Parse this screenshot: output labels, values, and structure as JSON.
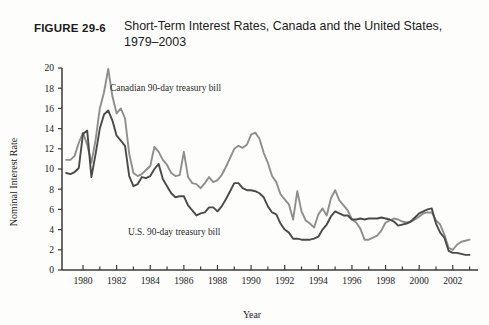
{
  "figure": {
    "number_label": "FIGURE 29-6",
    "caption": "Short-Term Interest Rates, Canada and the United States, 1979–2003"
  },
  "colors": {
    "canada_line": "#8e8e8e",
    "us_line": "#4a4a4a",
    "axis": "#3a3a3a",
    "text": "#1b1b1b",
    "background": "#fdfdfb"
  },
  "annotations": {
    "canada_series_label": "Canadian 90-day treasury bill",
    "us_series_label": "U.S. 90-day treasury bill"
  },
  "chart_data": {
    "type": "line",
    "title": "Short-Term Interest Rates, Canada and the United States, 1979–2003",
    "xlabel": "Year",
    "ylabel": "Nominal Interest Rate",
    "xlim": [
      1978.75,
      2003.5
    ],
    "ylim": [
      0,
      20
    ],
    "ytick_values": [
      0,
      2,
      4,
      6,
      8,
      10,
      12,
      14,
      16,
      18,
      20
    ],
    "ytick_labels": [
      "0",
      "2",
      "4",
      "6",
      "8",
      "10",
      "12",
      "14",
      "16",
      "18",
      "20"
    ],
    "xtick_values": [
      1980,
      1982,
      1984,
      1986,
      1988,
      1990,
      1992,
      1994,
      1996,
      1998,
      2000,
      2002
    ],
    "xtick_labels": [
      "1980",
      "1982",
      "1984",
      "1986",
      "1988",
      "1990",
      "1992",
      "1994",
      "1996",
      "1998",
      "2000",
      "2002"
    ],
    "xtick_minor_values": [
      1981,
      1983,
      1985,
      1987,
      1989,
      1991,
      1993,
      1995,
      1997,
      1999,
      2001,
      2003
    ],
    "grid": false,
    "legend_position": "inline-annotations",
    "series": [
      {
        "name": "Canadian 90-day treasury bill",
        "color": "#8e8e8e",
        "x": [
          1979.0,
          1979.25,
          1979.5,
          1979.75,
          1980.0,
          1980.25,
          1980.5,
          1980.75,
          1981.0,
          1981.25,
          1981.5,
          1981.75,
          1982.0,
          1982.25,
          1982.5,
          1982.75,
          1983.0,
          1983.25,
          1983.5,
          1983.75,
          1984.0,
          1984.25,
          1984.5,
          1984.75,
          1985.0,
          1985.25,
          1985.5,
          1985.75,
          1986.0,
          1986.25,
          1986.5,
          1986.75,
          1987.0,
          1987.25,
          1987.5,
          1987.75,
          1988.0,
          1988.25,
          1988.5,
          1988.75,
          1989.0,
          1989.25,
          1989.5,
          1989.75,
          1990.0,
          1990.25,
          1990.5,
          1990.75,
          1991.0,
          1991.25,
          1991.5,
          1991.75,
          1992.0,
          1992.25,
          1992.5,
          1992.75,
          1993.0,
          1993.25,
          1993.5,
          1993.75,
          1994.0,
          1994.25,
          1994.5,
          1994.75,
          1995.0,
          1995.25,
          1995.5,
          1995.75,
          1996.0,
          1996.25,
          1996.5,
          1996.75,
          1997.0,
          1997.25,
          1997.5,
          1997.75,
          1998.0,
          1998.25,
          1998.5,
          1998.75,
          1999.0,
          1999.25,
          1999.5,
          1999.75,
          2000.0,
          2000.25,
          2000.5,
          2000.75,
          2001.0,
          2001.25,
          2001.5,
          2001.75,
          2002.0,
          2002.25,
          2002.5,
          2002.75,
          2003.0
        ],
        "y": [
          10.9,
          10.9,
          11.3,
          12.6,
          13.6,
          12.4,
          10.6,
          12.9,
          16.0,
          17.6,
          19.9,
          17.2,
          15.5,
          16.0,
          15.0,
          11.5,
          9.6,
          9.3,
          9.5,
          9.9,
          10.3,
          12.2,
          11.7,
          10.9,
          10.4,
          9.6,
          9.3,
          9.4,
          11.7,
          9.2,
          8.6,
          8.5,
          8.1,
          8.6,
          9.2,
          8.7,
          8.9,
          9.4,
          10.2,
          11.1,
          12.0,
          12.3,
          12.1,
          12.4,
          13.4,
          13.6,
          13.0,
          11.6,
          10.6,
          9.3,
          8.7,
          7.5,
          7.0,
          6.5,
          5.0,
          7.8,
          5.8,
          4.9,
          4.6,
          4.2,
          5.5,
          6.1,
          5.4,
          7.1,
          7.9,
          6.9,
          6.4,
          5.9,
          5.0,
          4.7,
          4.1,
          3.0,
          3.0,
          3.2,
          3.4,
          3.9,
          4.7,
          4.9,
          5.1,
          5.0,
          4.8,
          4.7,
          4.8,
          5.0,
          5.3,
          5.6,
          5.7,
          5.7,
          4.9,
          4.5,
          3.5,
          2.2,
          2.0,
          2.5,
          2.8,
          2.9,
          3.0
        ]
      },
      {
        "name": "U.S. 90-day treasury bill",
        "color": "#4a4a4a",
        "x": [
          1979.0,
          1979.25,
          1979.5,
          1979.75,
          1980.0,
          1980.25,
          1980.5,
          1980.75,
          1981.0,
          1981.25,
          1981.5,
          1981.75,
          1982.0,
          1982.25,
          1982.5,
          1982.75,
          1983.0,
          1983.25,
          1983.5,
          1983.75,
          1984.0,
          1984.25,
          1984.5,
          1984.75,
          1985.0,
          1985.25,
          1985.5,
          1985.75,
          1986.0,
          1986.25,
          1986.5,
          1986.75,
          1987.0,
          1987.25,
          1987.5,
          1987.75,
          1988.0,
          1988.25,
          1988.5,
          1988.75,
          1989.0,
          1989.25,
          1989.5,
          1989.75,
          1990.0,
          1990.25,
          1990.5,
          1990.75,
          1991.0,
          1991.25,
          1991.5,
          1991.75,
          1992.0,
          1992.25,
          1992.5,
          1992.75,
          1993.0,
          1993.25,
          1993.5,
          1993.75,
          1994.0,
          1994.25,
          1994.5,
          1994.75,
          1995.0,
          1995.25,
          1995.5,
          1995.75,
          1996.0,
          1996.25,
          1996.5,
          1996.75,
          1997.0,
          1997.25,
          1997.5,
          1997.75,
          1998.0,
          1998.25,
          1998.5,
          1998.75,
          1999.0,
          1999.25,
          1999.5,
          1999.75,
          2000.0,
          2000.25,
          2000.5,
          2000.75,
          2001.0,
          2001.25,
          2001.5,
          2001.75,
          2002.0,
          2002.25,
          2002.5,
          2002.75,
          2003.0
        ],
        "y": [
          9.6,
          9.5,
          9.7,
          10.1,
          13.5,
          13.8,
          9.2,
          11.5,
          14.0,
          15.4,
          15.8,
          14.8,
          13.3,
          12.8,
          12.3,
          9.3,
          8.3,
          8.5,
          9.2,
          9.1,
          9.3,
          10.0,
          10.5,
          9.0,
          8.3,
          7.6,
          7.2,
          7.3,
          7.3,
          6.4,
          5.9,
          5.4,
          5.6,
          5.7,
          6.2,
          6.2,
          5.8,
          6.3,
          7.0,
          7.8,
          8.6,
          8.6,
          8.1,
          7.9,
          7.9,
          7.8,
          7.6,
          7.2,
          6.3,
          5.7,
          5.5,
          4.6,
          4.0,
          3.7,
          3.1,
          3.1,
          3.0,
          3.0,
          3.0,
          3.1,
          3.3,
          4.0,
          4.5,
          5.3,
          5.8,
          5.6,
          5.4,
          5.4,
          5.0,
          5.0,
          5.1,
          5.0,
          5.1,
          5.1,
          5.1,
          5.2,
          5.1,
          5.0,
          4.8,
          4.4,
          4.5,
          4.6,
          4.8,
          5.2,
          5.6,
          5.8,
          6.0,
          6.1,
          4.6,
          3.7,
          3.2,
          1.9,
          1.7,
          1.7,
          1.6,
          1.5,
          1.5
        ]
      }
    ]
  }
}
